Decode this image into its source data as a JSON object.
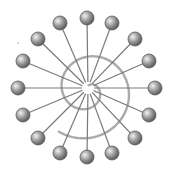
{
  "diagram": {
    "type": "radial-network",
    "center": {
      "x": 88,
      "y": 88
    },
    "node_radius": 7,
    "colors": {
      "background": "#ffffff",
      "node_fill_light": "#e6e6e6",
      "node_fill_dark": "#6a6a6a",
      "node_stroke": "#5a5a5a",
      "spoke": "#7a7a7a",
      "spiral": "#aaaaaa"
    },
    "nodes": [
      {
        "x": 87,
        "y": 18
      },
      {
        "x": 112,
        "y": 23
      },
      {
        "x": 135,
        "y": 39
      },
      {
        "x": 149,
        "y": 61
      },
      {
        "x": 155,
        "y": 88
      },
      {
        "x": 149,
        "y": 115
      },
      {
        "x": 135,
        "y": 138
      },
      {
        "x": 112,
        "y": 153
      },
      {
        "x": 87,
        "y": 157
      },
      {
        "x": 60,
        "y": 153
      },
      {
        "x": 38,
        "y": 138
      },
      {
        "x": 23,
        "y": 115
      },
      {
        "x": 18,
        "y": 88
      },
      {
        "x": 23,
        "y": 61
      },
      {
        "x": 38,
        "y": 39
      },
      {
        "x": 60,
        "y": 23
      }
    ]
  }
}
